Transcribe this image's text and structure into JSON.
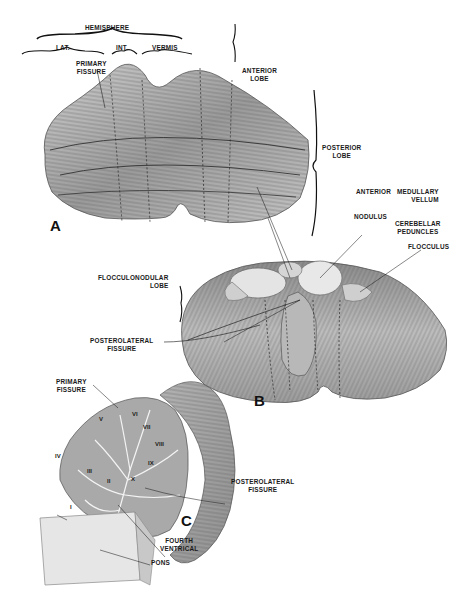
{
  "figure": {
    "panels": [
      {
        "id": "A",
        "label": "A"
      },
      {
        "id": "B",
        "label": "B"
      },
      {
        "id": "C",
        "label": "C"
      }
    ]
  },
  "panel_a": {
    "brackets": {
      "hemisphere": "HEMISPHERE",
      "lat": "LAT.",
      "int": "INT.",
      "vermis": "VERMIS"
    },
    "labels": {
      "primary_fissure_1": "PRIMARY",
      "primary_fissure_2": "FISSURE",
      "anterior_lobe_1": "ANTERIOR",
      "anterior_lobe_2": "LOBE",
      "posterior_lobe_1": "POSTERIOR",
      "posterior_lobe_2": "LOBE"
    }
  },
  "panel_b": {
    "labels": {
      "anterior": "ANTERIOR",
      "medullary_vellum_1": "MEDULLARY",
      "medullary_vellum_2": "VELLUM",
      "nodulus": "NODULUS",
      "cerebellar_peduncles_1": "CEREBELLAR",
      "cerebellar_peduncles_2": "PEDUNCLES",
      "flocculus": "FLOCCULUS",
      "flocculonodular_lobe_1": "FLOCCULONODULAR",
      "flocculonodular_lobe_2": "LOBE",
      "posterolateral_fissure_1": "POSTEROLATERAL",
      "posterolateral_fissure_2": "FISSURE"
    }
  },
  "panel_c": {
    "labels": {
      "primary_fissure_1": "PRIMARY",
      "primary_fissure_2": "FISSURE",
      "posterolateral_fissure_1": "POSTEROLATERAL",
      "posterolateral_fissure_2": "FISSURE",
      "fourth_ventrical_1": "FOURTH",
      "fourth_ventrical_2": "VENTRICAL",
      "pons": "PONS"
    },
    "lobules": [
      "I",
      "II",
      "III",
      "IV",
      "V",
      "VI",
      "VII",
      "VIII",
      "IX",
      "X"
    ]
  }
}
